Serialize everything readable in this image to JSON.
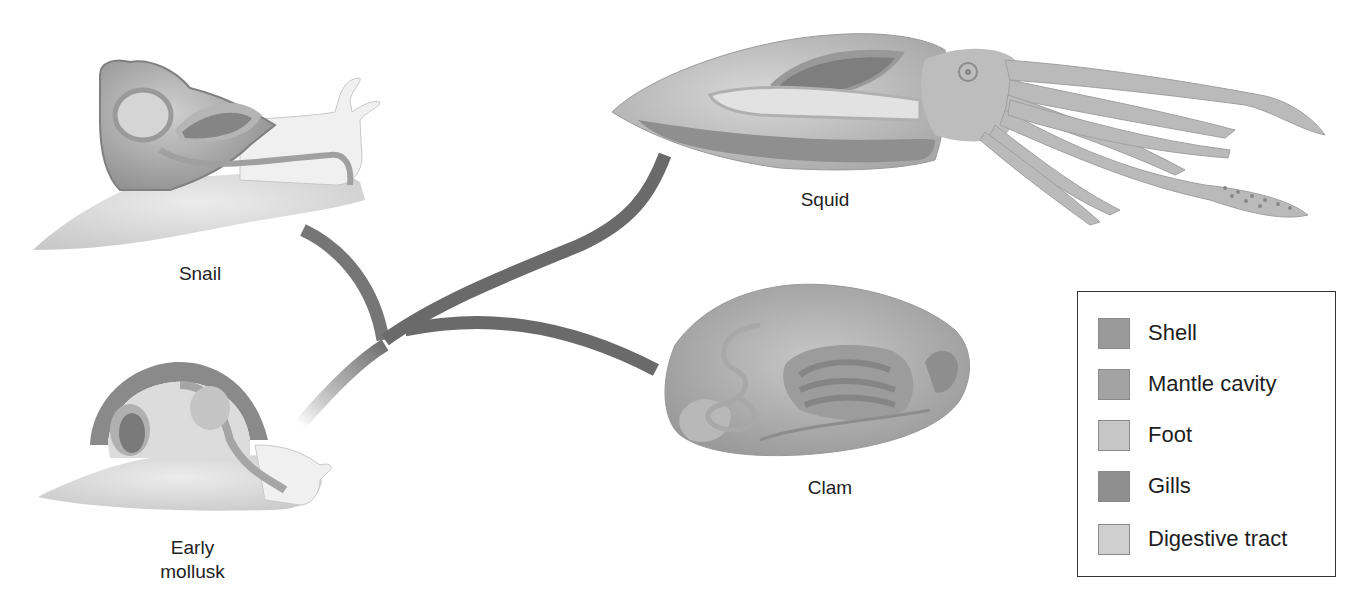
{
  "figure": {
    "type": "evolutionary-diagram",
    "organisms": [
      {
        "id": "snail",
        "label": "Snail"
      },
      {
        "id": "squid",
        "label": "Squid"
      },
      {
        "id": "clam",
        "label": "Clam"
      },
      {
        "id": "early-mollusk",
        "label_line1": "Early",
        "label_line2": "mollusk"
      }
    ],
    "branches": [
      {
        "from": "early-mollusk",
        "to": "snail"
      },
      {
        "from": "early-mollusk",
        "to": "squid"
      },
      {
        "from": "early-mollusk",
        "to": "clam"
      }
    ]
  },
  "legend": {
    "items": [
      {
        "label": "Shell",
        "color": "#9a9a9a"
      },
      {
        "label": "Mantle cavity",
        "color": "#a3a3a3"
      },
      {
        "label": "Foot",
        "color": "#c6c6c6"
      },
      {
        "label": "Gills",
        "color": "#8f8f8f"
      },
      {
        "label": "Digestive tract",
        "color": "#cfcfcf"
      }
    ]
  },
  "colors": {
    "branch": "#6e6e6e",
    "shell": "#9a9a9a",
    "mantle": "#a3a3a3",
    "foot": "#d6d6d6",
    "gills": "#7e7e7e",
    "digestive": "#bdbdbd"
  }
}
